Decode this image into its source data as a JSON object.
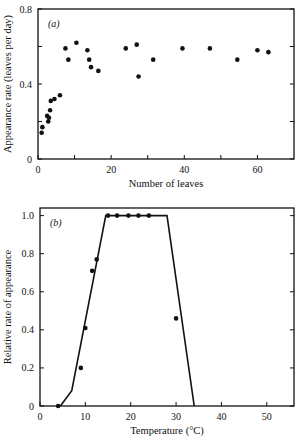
{
  "chart_data": [
    {
      "type": "scatter",
      "panel_label": "(a)",
      "title": "",
      "xlabel": "Number of leaves",
      "ylabel": "Appearance rate (leaves per day)",
      "xlim": [
        0,
        70
      ],
      "ylim": [
        0,
        0.8
      ],
      "xticks": [
        0,
        10,
        20,
        30,
        40,
        50,
        60
      ],
      "xtick_labels": [
        "0",
        "",
        "20",
        "",
        "40",
        "",
        "60"
      ],
      "yticks": [
        0,
        0.2,
        0.4,
        0.6,
        0.8
      ],
      "ytick_labels": [
        "0",
        "",
        "0.4",
        "",
        "0.8"
      ],
      "grid": false,
      "points": [
        {
          "x": 1,
          "y": 0.14
        },
        {
          "x": 1.2,
          "y": 0.17
        },
        {
          "x": 2.5,
          "y": 0.23
        },
        {
          "x": 2.8,
          "y": 0.2
        },
        {
          "x": 3,
          "y": 0.22
        },
        {
          "x": 3.3,
          "y": 0.26
        },
        {
          "x": 3.5,
          "y": 0.31
        },
        {
          "x": 4.5,
          "y": 0.32
        },
        {
          "x": 6,
          "y": 0.34
        },
        {
          "x": 7.5,
          "y": 0.59
        },
        {
          "x": 8.3,
          "y": 0.53
        },
        {
          "x": 10.5,
          "y": 0.62
        },
        {
          "x": 13.5,
          "y": 0.58
        },
        {
          "x": 14,
          "y": 0.53
        },
        {
          "x": 14.5,
          "y": 0.49
        },
        {
          "x": 16.5,
          "y": 0.47
        },
        {
          "x": 24,
          "y": 0.59
        },
        {
          "x": 27,
          "y": 0.61
        },
        {
          "x": 27.5,
          "y": 0.44
        },
        {
          "x": 31.5,
          "y": 0.53
        },
        {
          "x": 39.5,
          "y": 0.59
        },
        {
          "x": 47,
          "y": 0.59
        },
        {
          "x": 54.5,
          "y": 0.53
        },
        {
          "x": 60,
          "y": 0.58
        },
        {
          "x": 63,
          "y": 0.57
        }
      ]
    },
    {
      "type": "line",
      "panel_label": "(b)",
      "title": "",
      "xlabel": "Temperature (°C)",
      "ylabel": "Relative rate of appearance",
      "xlim": [
        0,
        56
      ],
      "ylim": [
        0,
        1.04
      ],
      "xticks": [
        0,
        10,
        20,
        30,
        40,
        50
      ],
      "xtick_labels": [
        "0",
        "10",
        "20",
        "30",
        "40",
        "50"
      ],
      "yticks": [
        0,
        0.2,
        0.4,
        0.6,
        0.8,
        1.0
      ],
      "ytick_labels": [
        "0",
        "0.2",
        "0.4",
        "0.6",
        "0.8",
        "1.0"
      ],
      "grid": false,
      "series": [
        {
          "name": "fitted response",
          "x": [
            4.5,
            7,
            14.5,
            28,
            34
          ],
          "y": [
            0,
            0.08,
            1.0,
            1.0,
            0
          ]
        }
      ],
      "points": [
        {
          "x": 4,
          "y": 0.0
        },
        {
          "x": 9,
          "y": 0.2
        },
        {
          "x": 10,
          "y": 0.41
        },
        {
          "x": 11.5,
          "y": 0.71
        },
        {
          "x": 12.5,
          "y": 0.77
        },
        {
          "x": 15,
          "y": 1.0
        },
        {
          "x": 17,
          "y": 1.0
        },
        {
          "x": 19.5,
          "y": 1.0
        },
        {
          "x": 21.7,
          "y": 1.0
        },
        {
          "x": 24,
          "y": 1.0
        },
        {
          "x": 30,
          "y": 0.46
        }
      ]
    }
  ]
}
